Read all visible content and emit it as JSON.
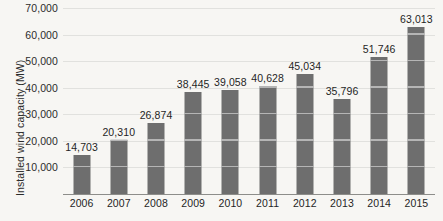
{
  "chart_data": {
    "type": "bar",
    "title": "",
    "xlabel": "",
    "ylabel": "Installed wind capacity (MW)",
    "categories": [
      "2006",
      "2007",
      "2008",
      "2009",
      "2010",
      "2011",
      "2012",
      "2013",
      "2014",
      "2015"
    ],
    "values": [
      14703,
      20310,
      26874,
      38445,
      39058,
      40628,
      45034,
      35796,
      51746,
      63013
    ],
    "value_labels": [
      "14,703",
      "20,310",
      "26,874",
      "38,445",
      "39,058",
      "40,628",
      "45,034",
      "35,796",
      "51,746",
      "63,013"
    ],
    "ylim": [
      0,
      70000
    ],
    "yticks": [
      10000,
      20000,
      30000,
      40000,
      50000,
      60000,
      70000
    ],
    "ytick_labels": [
      "10,000",
      "20,000",
      "30,000",
      "40,000",
      "50,000",
      "60,000",
      "70,000"
    ],
    "grid": true,
    "legend": false,
    "bar_color": "#6e6e6e",
    "background_color": "#f7f6f3",
    "axis_color": "#8d8d8a"
  }
}
